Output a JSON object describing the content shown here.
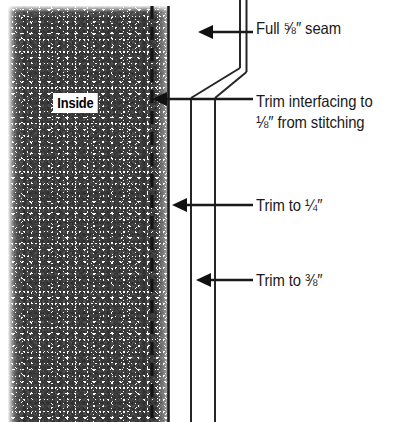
{
  "diagram": {
    "fabric_label": "Inside",
    "colors": {
      "ink": "#1a1a1a",
      "line": "#262626",
      "background": "#ffffff",
      "stipple": "#1a1a1a"
    },
    "callouts": [
      {
        "name": "full-seam",
        "line1": "Full ⅝″ seam",
        "line2": "",
        "arrow_tip_x": 198,
        "arrow_y": 32
      },
      {
        "name": "trim-interfacing",
        "line1": "Trim interfacing to",
        "line2": "⅛″ from stitching",
        "arrow_tip_x": 152,
        "arrow_y": 99
      },
      {
        "name": "trim-quarter",
        "line1": "Trim to ¼″",
        "line2": "",
        "arrow_tip_x": 172,
        "arrow_y": 205
      },
      {
        "name": "trim-eighth",
        "line1": "Trim to ⅜″",
        "line2": "",
        "arrow_tip_x": 196,
        "arrow_y": 280
      }
    ],
    "edges": {
      "stitching_line_label": "stitching line (dashed)",
      "fabric_edge_label": "fabric fold edge",
      "interfacing_edge_label": "interfacing cut edge",
      "seam_allowance_edge_label": "seam allowance cut edge"
    }
  }
}
